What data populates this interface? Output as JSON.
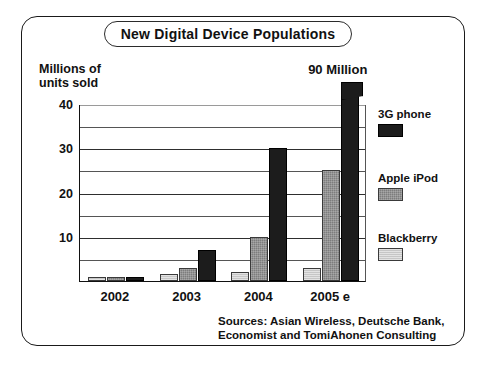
{
  "figure": {
    "title": "New Digital Device Populations",
    "y_axis_caption": "Millions of\nunits sold",
    "annotation_90m": "90 Million",
    "source_note": "Sources: Asian Wireless, Deutsche Bank,\nEconomist and TomiAhonen Consulting"
  },
  "legend": {
    "items": [
      {
        "label": "3G phone",
        "color": "#1c1c1c",
        "swatch_class": "s-3g"
      },
      {
        "label": "Apple iPod",
        "color": "#7d7d7d",
        "swatch_class": "s-ipod"
      },
      {
        "label": "Blackberry",
        "color": "#c6c6c6",
        "swatch_class": "s-bb"
      }
    ]
  },
  "chart_data": {
    "type": "bar",
    "title": "New Digital Device Populations",
    "xlabel": "",
    "ylabel": "Millions of units sold",
    "ylim": [
      0,
      40
    ],
    "yticks": [
      10,
      20,
      30,
      40
    ],
    "gridlines": [
      5,
      10,
      15,
      20,
      25,
      30,
      35,
      40
    ],
    "grid": true,
    "legend_position": "right",
    "categories": [
      "2002",
      "2003",
      "2004",
      "2005 e"
    ],
    "series": [
      {
        "name": "Blackberry",
        "color": "#c6c6c6",
        "values": [
          1,
          1.5,
          2,
          3
        ]
      },
      {
        "name": "Apple iPod",
        "color": "#7d7d7d",
        "values": [
          1,
          3,
          10,
          25
        ]
      },
      {
        "name": "3G phone",
        "color": "#1c1c1c",
        "values": [
          1,
          7,
          30,
          90
        ]
      }
    ],
    "annotations": [
      {
        "text": "90 Million",
        "series": "3G phone",
        "category": "2005 e",
        "note": "bar is clipped / axis-broken above 40"
      }
    ],
    "source": "Sources: Asian Wireless, Deutsche Bank, Economist and TomiAhonen Consulting"
  }
}
